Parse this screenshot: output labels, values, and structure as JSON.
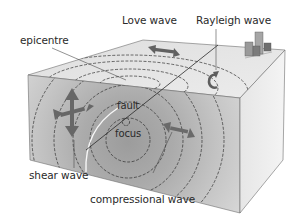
{
  "diagram": {
    "type": "earthquake block diagram",
    "labels": {
      "love_wave": "Love wave",
      "rayleigh_wave": "Rayleigh wave",
      "epicentre": "epicentre",
      "fault": "fault",
      "focus": "focus",
      "shear_wave": "shear wave",
      "compressional_wave": "compressional wave"
    },
    "colors": {
      "top_face": "#e4e4e4",
      "front_face": "#c8c8c8",
      "front_face_inner": "#a9a9a9",
      "right_face": "#ededed",
      "arrow": "#6a6a6a",
      "dashed_wave": "#333333",
      "text": "#2a2a2a"
    }
  }
}
